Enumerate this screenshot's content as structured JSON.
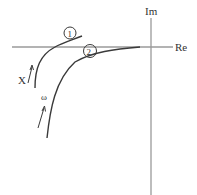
{
  "diagram": {
    "type": "nyquist-plot",
    "axes": {
      "real_label": "Re",
      "imag_label": "Im",
      "axis_color": "#9a9a9a"
    },
    "curves": [
      {
        "id": "1",
        "label": "1",
        "color": "#3a3a3a"
      },
      {
        "id": "2",
        "label": "2",
        "color": "#3a3a3a"
      }
    ],
    "annotations": {
      "x_label": "X",
      "omega_label": "ω"
    }
  }
}
